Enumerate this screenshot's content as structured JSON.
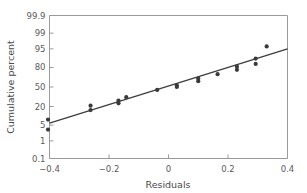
{
  "chart_data": {
    "type": "scatter",
    "title": "",
    "subtitle": "",
    "xlabel": "Residuals",
    "ylabel": "Cumulative percent",
    "xlim": [
      -0.4,
      0.4
    ],
    "ylim": [
      0.1,
      99.9
    ],
    "yscale": "normal-probability",
    "grid": false,
    "legend": null,
    "xticks": [
      -0.4,
      -0.2,
      0,
      0.2,
      0.4
    ],
    "xticklabels": [
      "−0.4",
      "−0.2",
      "0",
      "0.2",
      "0.4"
    ],
    "yticks": [
      0.1,
      1,
      5,
      20,
      50,
      80,
      95,
      99,
      99.9
    ],
    "yticklabels": [
      "0.1",
      "1",
      "5",
      "20",
      "50",
      "80",
      "95",
      "99",
      "99.9"
    ],
    "series": [
      {
        "name": "Residual quantiles",
        "type": "scatter",
        "marker": "circle",
        "color": "#3a3a3a",
        "points": [
          {
            "x": -0.405,
            "y": 3.3
          },
          {
            "x": -0.405,
            "y": 8.0
          },
          {
            "x": -0.262,
            "y": 16.0
          },
          {
            "x": -0.262,
            "y": 21.0
          },
          {
            "x": -0.168,
            "y": 24.0
          },
          {
            "x": -0.168,
            "y": 28.0
          },
          {
            "x": -0.142,
            "y": 33.0
          },
          {
            "x": -0.038,
            "y": 45.0
          },
          {
            "x": 0.028,
            "y": 50.0
          },
          {
            "x": 0.028,
            "y": 53.0
          },
          {
            "x": 0.1,
            "y": 60.0
          },
          {
            "x": 0.1,
            "y": 64.0
          },
          {
            "x": 0.165,
            "y": 71.0
          },
          {
            "x": 0.23,
            "y": 77.0
          },
          {
            "x": 0.23,
            "y": 81.0
          },
          {
            "x": 0.293,
            "y": 84.0
          },
          {
            "x": 0.293,
            "y": 89.0
          },
          {
            "x": 0.33,
            "y": 96.0
          }
        ]
      },
      {
        "name": "Reference line",
        "type": "line",
        "color": "#3c3c3c",
        "endpoints": [
          {
            "x": -0.4,
            "y": 6.0
          },
          {
            "x": 0.4,
            "y": 95.0
          }
        ]
      }
    ]
  },
  "figure": {
    "background_color": "#ffffff",
    "axis_color": "#9a9a9a",
    "text_color": "#5a5a5a",
    "marker_color": "#3a3a3a",
    "line_color": "#3c3c3c"
  }
}
